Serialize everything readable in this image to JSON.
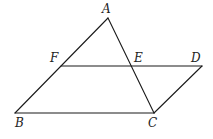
{
  "figure": {
    "points": {
      "A": {
        "x": 108,
        "y": 18,
        "label": "A",
        "lx": 102,
        "ly": 13
      },
      "B": {
        "x": 15,
        "y": 113,
        "label": "B",
        "lx": 15,
        "ly": 127
      },
      "C": {
        "x": 154,
        "y": 113,
        "label": "C",
        "lx": 148,
        "ly": 127
      },
      "D": {
        "x": 202,
        "y": 66,
        "label": "D",
        "lx": 191,
        "ly": 62
      },
      "E": {
        "x": 131,
        "y": 66,
        "label": "E",
        "lx": 134,
        "ly": 62
      },
      "F": {
        "x": 61,
        "y": 66,
        "label": "F",
        "lx": 50,
        "ly": 62
      }
    },
    "segments": [
      {
        "from": "A",
        "to": "B"
      },
      {
        "from": "A",
        "to": "C"
      },
      {
        "from": "B",
        "to": "C"
      },
      {
        "from": "F",
        "to": "D"
      },
      {
        "from": "C",
        "to": "D"
      }
    ],
    "line_color": "#1a1a1a",
    "label_color": "#222222"
  }
}
